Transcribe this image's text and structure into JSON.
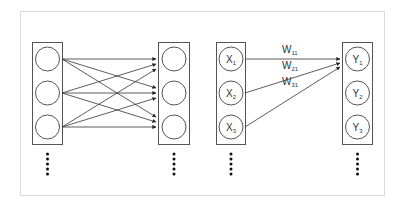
{
  "diagram": {
    "title": "",
    "left_panel": {
      "description": "Fully connected layer: 3 input nodes each connected to 3 output nodes",
      "input_nodes": [
        "",
        "",
        ""
      ],
      "output_nodes": [
        "",
        "",
        ""
      ],
      "continuation": "vertical dots"
    },
    "right_panel": {
      "description": "Weights from inputs to Y1",
      "inputs": [
        {
          "base": "X",
          "sub": "1"
        },
        {
          "base": "X",
          "sub": "2"
        },
        {
          "base": "X",
          "sub": "3"
        }
      ],
      "outputs": [
        {
          "base": "Y",
          "sub": "1"
        },
        {
          "base": "Y",
          "sub": "2"
        },
        {
          "base": "Y",
          "sub": "3"
        }
      ],
      "weights": [
        {
          "base": "W",
          "sub": "11"
        },
        {
          "base": "W",
          "sub": "21"
        },
        {
          "base": "W",
          "sub": "31"
        }
      ],
      "continuation": "vertical dots"
    },
    "colors": {
      "frame": "#d9d9d9",
      "stroke": "#555555",
      "edge": "#333333",
      "dot": "#111111"
    }
  }
}
